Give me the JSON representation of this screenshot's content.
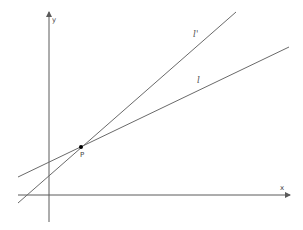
{
  "diagram": {
    "axes": {
      "x_label": "x",
      "y_label": "y"
    },
    "lines": [
      {
        "name": "l",
        "label": "l"
      },
      {
        "name": "l-prime",
        "label": "l'"
      }
    ],
    "point": {
      "label": "P"
    },
    "colors": {
      "axis": "#5a5a5a",
      "line": "#6a6a6a",
      "point": "#000000",
      "background": "#ffffff"
    }
  }
}
